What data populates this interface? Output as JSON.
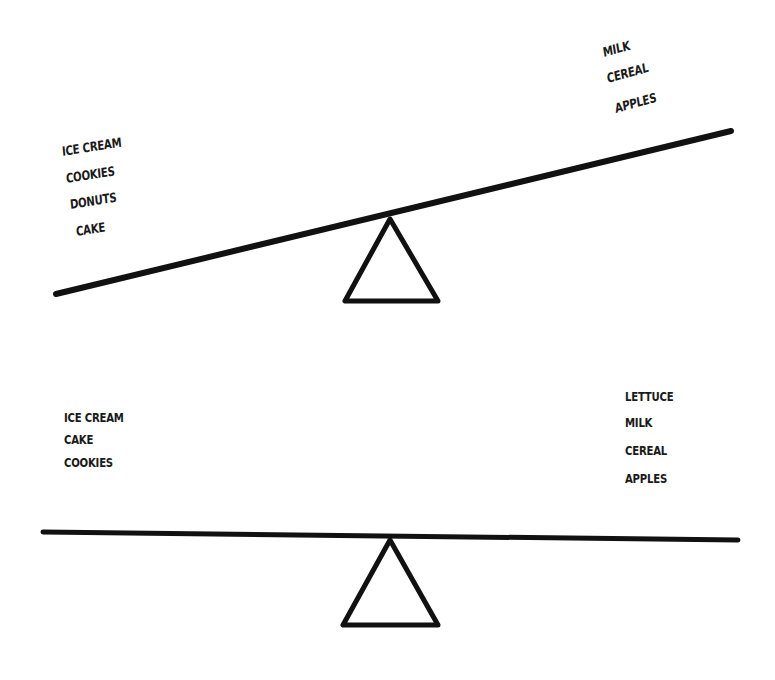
{
  "diagram": {
    "type": "balance-scales",
    "ink_color": "#111111",
    "background_color": "#ffffff",
    "scales": [
      {
        "id": "tilted",
        "state": "tipped toward left (sweets side heavier)",
        "left_pan": {
          "items": [
            "ICE CREAM",
            "COOKIES",
            "DONUTS",
            "CAKE"
          ]
        },
        "right_pan": {
          "items": [
            "MILK",
            "CEREAL",
            "APPLES"
          ]
        }
      },
      {
        "id": "balanced",
        "state": "level (balanced)",
        "left_pan": {
          "items": [
            "ICE CREAM",
            "CAKE",
            "COOKIES"
          ]
        },
        "right_pan": {
          "items": [
            "LETTUCE",
            "MILK",
            "CEREAL",
            "APPLES"
          ]
        }
      }
    ]
  }
}
